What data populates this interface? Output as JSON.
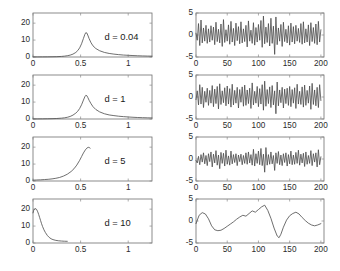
{
  "figure": {
    "background": "#ffffff",
    "line_color": "#4a4a4a",
    "axis_color": "#6f6f6f",
    "rows": 4,
    "columns": 2
  },
  "chart_data": [
    {
      "id": "left-d-0-04",
      "type": "line",
      "title": "",
      "annotation": "d = 0.04",
      "xlabel": "",
      "ylabel": "",
      "xlim": [
        0,
        1.25
      ],
      "ylim": [
        0,
        26
      ],
      "xticks": [
        0,
        0.5,
        1
      ],
      "xticklabels": [
        "0",
        "0.5",
        "1"
      ],
      "yticks": [
        0,
        10,
        20
      ],
      "yticklabels": [
        "0",
        "10",
        "20"
      ],
      "grid": false,
      "legend": null,
      "x": [
        0,
        0.05,
        0.1,
        0.15,
        0.2,
        0.25,
        0.3,
        0.33,
        0.36,
        0.39,
        0.42,
        0.45,
        0.47,
        0.49,
        0.51,
        0.53,
        0.545,
        0.555,
        0.565,
        0.575,
        0.59,
        0.61,
        0.63,
        0.66,
        0.7,
        0.75,
        0.8,
        0.85,
        0.9,
        0.95,
        1.0,
        1.05,
        1.1,
        1.15,
        1.2,
        1.25
      ],
      "y": [
        0.05,
        0.06,
        0.08,
        0.1,
        0.14,
        0.2,
        0.35,
        0.5,
        0.75,
        1.1,
        1.7,
        2.7,
        3.8,
        5.4,
        7.8,
        11.0,
        13.4,
        14.4,
        14.2,
        13.0,
        10.8,
        8.4,
        6.6,
        5.0,
        3.7,
        2.7,
        2.1,
        1.7,
        1.4,
        1.15,
        1.0,
        0.85,
        0.72,
        0.62,
        0.55,
        0.5
      ]
    },
    {
      "id": "left-d-1",
      "type": "line",
      "title": "",
      "annotation": "d = 1",
      "xlabel": "",
      "ylabel": "",
      "xlim": [
        0,
        1.25
      ],
      "ylim": [
        0,
        26
      ],
      "xticks": [
        0,
        0.5,
        1
      ],
      "xticklabels": [
        "0",
        "0.5",
        "1"
      ],
      "yticks": [
        0,
        10,
        20
      ],
      "yticklabels": [
        "0",
        "10",
        "20"
      ],
      "grid": false,
      "legend": null,
      "x": [
        0,
        0.05,
        0.1,
        0.15,
        0.2,
        0.25,
        0.3,
        0.33,
        0.36,
        0.39,
        0.42,
        0.45,
        0.47,
        0.49,
        0.51,
        0.53,
        0.545,
        0.555,
        0.565,
        0.575,
        0.59,
        0.61,
        0.63,
        0.66,
        0.7,
        0.75,
        0.8,
        0.85,
        0.9,
        0.95,
        1.0,
        1.05,
        1.1,
        1.15,
        1.2,
        1.25
      ],
      "y": [
        0.05,
        0.07,
        0.1,
        0.14,
        0.2,
        0.3,
        0.5,
        0.7,
        1.0,
        1.5,
        2.3,
        3.5,
        4.6,
        6.2,
        8.4,
        11.2,
        13.2,
        14.0,
        13.8,
        12.8,
        11.0,
        9.0,
        7.3,
        5.6,
        4.2,
        3.1,
        2.4,
        2.0,
        1.65,
        1.4,
        1.2,
        1.02,
        0.88,
        0.78,
        0.7,
        0.62
      ]
    },
    {
      "id": "left-d-5",
      "type": "line",
      "title": "",
      "annotation": "d = 5",
      "xlabel": "",
      "ylabel": "",
      "xlim": [
        0,
        1.25
      ],
      "ylim": [
        0,
        26
      ],
      "xticks": [
        0,
        0.5,
        1
      ],
      "xticklabels": [
        "0",
        "0.5",
        "1"
      ],
      "yticks": [
        0,
        10,
        20
      ],
      "yticklabels": [
        "0",
        "10",
        "20"
      ],
      "grid": false,
      "legend": null,
      "x": [
        0,
        0.04,
        0.08,
        0.12,
        0.16,
        0.2,
        0.24,
        0.28,
        0.32,
        0.36,
        0.4,
        0.43,
        0.46,
        0.49,
        0.51,
        0.53,
        0.55,
        0.565,
        0.58,
        0.59,
        0.6
      ],
      "y": [
        0.5,
        0.6,
        0.7,
        0.85,
        1.0,
        1.25,
        1.6,
        2.1,
        2.9,
        4.0,
        5.6,
        7.2,
        9.4,
        12.2,
        14.4,
        16.6,
        18.4,
        19.4,
        19.9,
        19.8,
        19.4
      ]
    },
    {
      "id": "left-d-10",
      "type": "line",
      "title": "",
      "annotation": "d = 10",
      "xlabel": "",
      "ylabel": "",
      "xlim": [
        0,
        1.25
      ],
      "ylim": [
        0,
        26
      ],
      "xticks": [
        0,
        0.5,
        1
      ],
      "xticklabels": [
        "0",
        "0.5",
        "1"
      ],
      "yticks": [
        0,
        10,
        20
      ],
      "yticklabels": [
        "0",
        "10",
        "20"
      ],
      "grid": false,
      "legend": null,
      "x": [
        0,
        0.008,
        0.016,
        0.024,
        0.032,
        0.04,
        0.05,
        0.06,
        0.07,
        0.08,
        0.09,
        0.1,
        0.115,
        0.13,
        0.15,
        0.17,
        0.19,
        0.21,
        0.24,
        0.27,
        0.3,
        0.33,
        0.36
      ],
      "y": [
        17.8,
        19.4,
        20.1,
        20.3,
        20.2,
        19.6,
        18.4,
        16.8,
        15.0,
        13.2,
        11.4,
        9.8,
        7.8,
        6.2,
        4.5,
        3.3,
        2.5,
        2.0,
        1.55,
        1.3,
        1.15,
        1.05,
        1.0
      ]
    },
    {
      "id": "right-signal-1",
      "type": "line",
      "title": "",
      "annotation": "",
      "xlabel": "",
      "ylabel": "",
      "xlim": [
        0,
        205
      ],
      "ylim": [
        -5,
        5
      ],
      "xticks": [
        0,
        50,
        100,
        150,
        200
      ],
      "xticklabels": [
        "0",
        "50",
        "100",
        "150",
        "200"
      ],
      "yticks": [
        -5,
        0,
        5
      ],
      "yticklabels": [
        "-5",
        "0",
        "5"
      ],
      "grid": false,
      "legend": null,
      "x": [
        0,
        2,
        4,
        6,
        8,
        10,
        12,
        14,
        16,
        18,
        20,
        22,
        24,
        26,
        28,
        30,
        32,
        34,
        36,
        38,
        40,
        42,
        44,
        46,
        48,
        50,
        52,
        54,
        56,
        58,
        60,
        62,
        64,
        66,
        68,
        70,
        72,
        74,
        76,
        78,
        80,
        82,
        84,
        86,
        88,
        90,
        92,
        94,
        96,
        98,
        100,
        102,
        104,
        106,
        108,
        110,
        112,
        114,
        116,
        118,
        120,
        122,
        124,
        126,
        128,
        130,
        132,
        134,
        136,
        138,
        140,
        142,
        144,
        146,
        148,
        150,
        152,
        154,
        156,
        158,
        160,
        162,
        164,
        166,
        168,
        170,
        172,
        174,
        176,
        178,
        180,
        182,
        184,
        186,
        188,
        190,
        192,
        194,
        196,
        198,
        200
      ],
      "y": [
        0.4,
        -1.2,
        2.6,
        -2.4,
        3.4,
        -1.8,
        1.6,
        -1.4,
        2.2,
        -1.9,
        1.4,
        -1.6,
        2.1,
        -1.2,
        1.8,
        -2.2,
        2.9,
        -1.5,
        1.3,
        -1.8,
        2.5,
        -2.6,
        3.5,
        -1.7,
        1.2,
        -1.4,
        2.3,
        -2.1,
        3.1,
        -1.6,
        1.5,
        -2.4,
        2.7,
        -1.3,
        1.9,
        -2.0,
        3.0,
        -1.8,
        1.4,
        -1.5,
        2.2,
        -2.7,
        3.2,
        -1.4,
        1.1,
        -1.9,
        2.8,
        -2.3,
        1.7,
        -1.6,
        2.4,
        -1.2,
        3.3,
        -2.8,
        4.3,
        -2.0,
        1.8,
        -1.7,
        2.6,
        -2.5,
        3.8,
        -1.9,
        2.0,
        -4.4,
        4.1,
        -2.2,
        1.6,
        -1.4,
        2.4,
        -2.6,
        2.9,
        -1.5,
        1.3,
        -1.8,
        2.1,
        -2.3,
        2.7,
        -1.6,
        1.9,
        -2.0,
        2.2,
        -1.4,
        1.5,
        -1.7,
        2.6,
        -2.1,
        3.0,
        -1.8,
        1.4,
        -1.6,
        2.3,
        -2.4,
        2.8,
        -1.5,
        1.7,
        -1.9,
        2.5,
        -2.2,
        3.1,
        -1.6,
        1.2
      ]
    },
    {
      "id": "right-signal-2",
      "type": "line",
      "title": "",
      "annotation": "",
      "xlabel": "",
      "ylabel": "",
      "xlim": [
        0,
        205
      ],
      "ylim": [
        -5,
        5
      ],
      "xticks": [
        0,
        50,
        100,
        150,
        200
      ],
      "xticklabels": [
        "0",
        "50",
        "100",
        "150",
        "200"
      ],
      "yticks": [
        -5,
        0,
        5
      ],
      "yticklabels": [
        "-5",
        "0",
        "5"
      ],
      "grid": false,
      "legend": null,
      "x": [
        0,
        2,
        4,
        6,
        8,
        10,
        12,
        14,
        16,
        18,
        20,
        22,
        24,
        26,
        28,
        30,
        32,
        34,
        36,
        38,
        40,
        42,
        44,
        46,
        48,
        50,
        52,
        54,
        56,
        58,
        60,
        62,
        64,
        66,
        68,
        70,
        72,
        74,
        76,
        78,
        80,
        82,
        84,
        86,
        88,
        90,
        92,
        94,
        96,
        98,
        100,
        102,
        104,
        106,
        108,
        110,
        112,
        114,
        116,
        118,
        120,
        122,
        124,
        126,
        128,
        130,
        132,
        134,
        136,
        138,
        140,
        142,
        144,
        146,
        148,
        150,
        152,
        154,
        156,
        158,
        160,
        162,
        164,
        166,
        168,
        170,
        172,
        174,
        176,
        178,
        180,
        182,
        184,
        186,
        188,
        190,
        192,
        194,
        196,
        198,
        200
      ],
      "y": [
        -0.6,
        1.4,
        -1.8,
        2.8,
        -1.6,
        2.2,
        -2.4,
        1.3,
        -1.2,
        2.0,
        -1.9,
        1.5,
        -1.4,
        2.6,
        -2.2,
        1.8,
        -1.5,
        2.4,
        -2.7,
        3.0,
        -1.7,
        1.4,
        -1.3,
        2.1,
        -2.0,
        2.5,
        -1.6,
        1.9,
        -2.3,
        2.9,
        -1.8,
        1.5,
        -1.4,
        2.2,
        -2.5,
        1.7,
        -1.2,
        2.3,
        -2.1,
        2.7,
        -1.9,
        1.6,
        -1.5,
        2.0,
        -2.6,
        3.2,
        -1.8,
        1.3,
        -1.4,
        2.4,
        -2.2,
        1.9,
        -1.6,
        2.8,
        -3.0,
        3.6,
        -2.1,
        1.7,
        -1.5,
        2.3,
        -2.4,
        2.6,
        -1.8,
        1.4,
        -3.8,
        3.4,
        -2.0,
        1.6,
        -1.3,
        2.2,
        -2.5,
        1.8,
        -1.5,
        2.0,
        -1.9,
        2.4,
        -2.2,
        1.7,
        -1.4,
        2.1,
        -2.6,
        2.9,
        -1.6,
        1.3,
        -1.7,
        2.3,
        -2.3,
        2.7,
        -1.9,
        1.5,
        -1.4,
        2.5,
        -2.8,
        3.1,
        -1.7,
        1.6,
        -2.0,
        2.2,
        -2.4,
        2.8,
        -0.8
      ]
    },
    {
      "id": "right-signal-3",
      "type": "line",
      "title": "",
      "annotation": "",
      "xlabel": "",
      "ylabel": "",
      "xlim": [
        0,
        205
      ],
      "ylim": [
        -5,
        5
      ],
      "xticks": [
        0,
        50,
        100,
        150,
        200
      ],
      "xticklabels": [
        "0",
        "50",
        "100",
        "150",
        "200"
      ],
      "yticks": [
        -5,
        0,
        5
      ],
      "yticklabels": [
        "-5",
        "0",
        "5"
      ],
      "grid": false,
      "legend": null,
      "x": [
        0,
        2,
        4,
        6,
        8,
        10,
        12,
        14,
        16,
        18,
        20,
        22,
        24,
        26,
        28,
        30,
        32,
        34,
        36,
        38,
        40,
        42,
        44,
        46,
        48,
        50,
        52,
        54,
        56,
        58,
        60,
        62,
        64,
        66,
        68,
        70,
        72,
        74,
        76,
        78,
        80,
        82,
        84,
        86,
        88,
        90,
        92,
        94,
        96,
        98,
        100,
        102,
        104,
        106,
        108,
        110,
        112,
        114,
        116,
        118,
        120,
        122,
        124,
        126,
        128,
        130,
        132,
        134,
        136,
        138,
        140,
        142,
        144,
        146,
        148,
        150,
        152,
        154,
        156,
        158,
        160,
        162,
        164,
        166,
        168,
        170,
        172,
        174,
        176,
        178,
        180,
        182,
        184,
        186,
        188,
        190,
        192,
        194,
        196,
        198,
        200
      ],
      "y": [
        -0.3,
        -0.9,
        0.6,
        -1.3,
        1.0,
        -0.7,
        1.4,
        -1.1,
        0.8,
        -1.5,
        1.2,
        -0.6,
        1.6,
        -1.8,
        1.1,
        -0.9,
        1.9,
        -1.4,
        0.9,
        -2.2,
        1.5,
        -1.0,
        1.3,
        -1.6,
        2.0,
        -1.2,
        0.7,
        -1.4,
        1.8,
        -1.1,
        1.0,
        -0.8,
        1.2,
        -1.5,
        0.9,
        -0.6,
        1.1,
        -1.3,
        0.8,
        -1.0,
        1.4,
        -1.2,
        1.6,
        -0.9,
        1.0,
        -1.4,
        2.2,
        -1.6,
        1.2,
        -1.0,
        1.8,
        -1.3,
        2.4,
        -1.5,
        1.1,
        -3.0,
        2.6,
        -1.4,
        1.0,
        -1.2,
        1.6,
        -1.1,
        0.8,
        -2.6,
        1.4,
        -1.0,
        1.7,
        -1.3,
        0.9,
        -1.5,
        1.2,
        -0.8,
        1.4,
        -1.6,
        1.0,
        -1.1,
        1.8,
        -1.3,
        0.9,
        -1.2,
        1.5,
        -1.0,
        2.0,
        -1.4,
        1.1,
        -0.9,
        1.3,
        -1.7,
        1.6,
        -1.2,
        0.8,
        -1.0,
        1.9,
        -1.5,
        1.2,
        -0.7,
        1.4,
        -1.8,
        2.1,
        -1.3,
        0.5
      ]
    },
    {
      "id": "right-signal-4",
      "type": "line",
      "title": "",
      "annotation": "",
      "xlabel": "",
      "ylabel": "",
      "xlim": [
        0,
        205
      ],
      "ylim": [
        -5,
        5
      ],
      "xticks": [
        0,
        50,
        100,
        150,
        200
      ],
      "xticklabels": [
        "0",
        "50",
        "100",
        "150",
        "200"
      ],
      "yticks": [
        -5,
        0,
        5
      ],
      "yticklabels": [
        "-5",
        "0",
        "5"
      ],
      "grid": false,
      "legend": null,
      "x": [
        0,
        5,
        10,
        15,
        20,
        25,
        30,
        35,
        40,
        45,
        50,
        55,
        60,
        65,
        70,
        75,
        80,
        85,
        90,
        95,
        100,
        105,
        110,
        115,
        120,
        125,
        130,
        133,
        136,
        140,
        145,
        150,
        155,
        160,
        165,
        170,
        175,
        180,
        185,
        190,
        195,
        200
      ],
      "y": [
        -0.6,
        1.3,
        1.9,
        1.6,
        0.5,
        -1.1,
        -2.0,
        -2.2,
        -2.1,
        -1.7,
        -1.2,
        -0.7,
        -0.2,
        0.4,
        0.9,
        1.3,
        1.1,
        1.7,
        2.3,
        2.0,
        2.6,
        3.2,
        3.6,
        2.4,
        0.6,
        -1.6,
        -3.4,
        -3.8,
        -3.0,
        -1.4,
        0.2,
        1.2,
        1.7,
        2.0,
        1.6,
        0.8,
        0.1,
        -0.5,
        -0.9,
        -1.1,
        -0.9,
        -0.6
      ]
    }
  ]
}
